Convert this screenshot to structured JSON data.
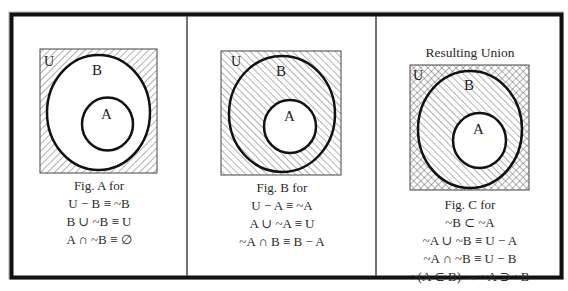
{
  "figures": [
    {
      "id": "fig-a",
      "shading": "complement of B (outside B) hatched",
      "labels": {
        "universe": "U",
        "outer_set": "B",
        "inner_set": "A"
      },
      "caption": [
        "Fig. A for",
        "U − B ≡ ~B",
        "B ∪ ~B ≡ U",
        "A ∩ ~B ≡ ∅"
      ]
    },
    {
      "id": "fig-b",
      "shading": "complement of A (outside A) hatched",
      "labels": {
        "universe": "U",
        "outer_set": "B",
        "inner_set": "A"
      },
      "caption": [
        "Fig. B for",
        "U − A ≡ ~A",
        "A ∪ ~A ≡ U",
        "~A ∩ B ≡ B − A"
      ]
    },
    {
      "id": "fig-c",
      "title": "Resulting Union",
      "shading": "outside B cross-hatched, B minus A hatched",
      "labels": {
        "universe": "U",
        "outer_set": "B",
        "inner_set": "A"
      },
      "caption": [
        "Fig. C for",
        "~B ⊂ ~A",
        "~A ∪ ~B ≡ U − A",
        "~A ∩ ~B ≡ U − B",
        "~(A ⊂ B) → ~A ⊃ ~B"
      ]
    }
  ],
  "colors": {
    "stroke": "#111111",
    "hatch": "#555555",
    "background": "#ffffff"
  }
}
